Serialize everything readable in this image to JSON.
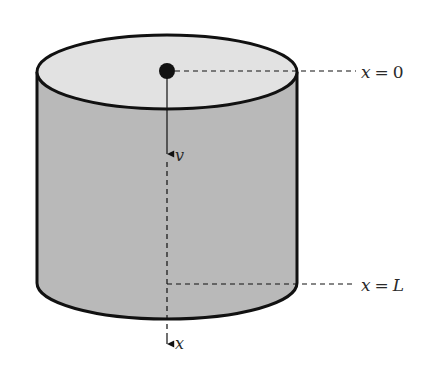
{
  "diagram": {
    "type": "cylinder-cross-section",
    "colors": {
      "top_face": "#e2e2e2",
      "side_face": "#b9b9b9",
      "outline": "#111111",
      "background": "#ffffff",
      "text": "#2a2a2a"
    },
    "labels": {
      "top_var": "x",
      "top_eq": "=",
      "top_val": "0",
      "bottom_var": "x",
      "bottom_eq": "=",
      "bottom_val": "L",
      "velocity": "v",
      "axis": "x"
    },
    "elements": [
      "cylinder",
      "top-ellipse",
      "center-point",
      "velocity-arrow",
      "x-axis-dashed",
      "x0-reference-line",
      "xL-reference-line"
    ]
  }
}
